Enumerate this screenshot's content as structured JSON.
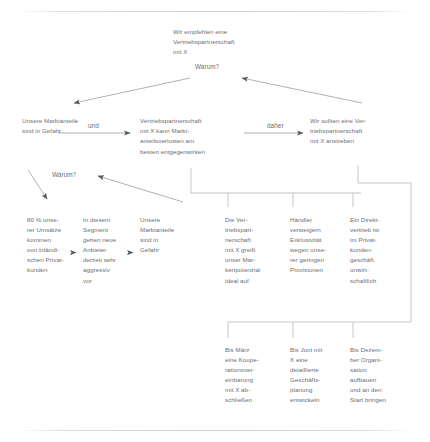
{
  "document": {
    "language": "de",
    "type": "pyramid-argument-diagram",
    "text_color": "#6d6e71",
    "line_color": "#8c8e90",
    "background": "#ffffff"
  },
  "top_statement": {
    "text": "Wir empfehlen eine\nVertriebspartnerschaft\nmit X"
  },
  "labels": {
    "warum_top": "Warum?",
    "warum_bottom": "Warum?"
  },
  "argument_row": {
    "left": {
      "text": "Unsere Marktanteile\nsind in Gefahr"
    },
    "connector_1": "und",
    "middle": {
      "text": "Vertriebspartnerschaft\nmit X kann Markt-\nanteilsverlusten am\nbesten entgegenwirken"
    },
    "connector_2": "daher",
    "right": {
      "text": "Wir sollten eine Ver-\ntriebspartnerschaft\nmit X anstreben"
    }
  },
  "evidence_columns": [
    {
      "id": "col-0",
      "text": "80 % unse-\nrer Umsätze\nkommen\nvon inländi-\nschen Privat-\nkunden"
    },
    {
      "id": "col-1",
      "text": "In diesem\nSegment\ngehen neue\nAnbieter\nderzeit sehr\naggressiv\nvor"
    },
    {
      "id": "col-2",
      "text": "Unsere\nMarktanteile\nsind in\nGefahr"
    },
    {
      "id": "col-3",
      "text": "Die Ver-\ntriebspart-\nnerschaft\nmit X greift\nunser Mar-\nkenpotenzial\nideal auf"
    },
    {
      "id": "col-4",
      "text": "Händler\nverweigern\nExklusivität\nwegen unse-\nrer geringen\nProvisionen"
    },
    {
      "id": "col-5",
      "text": "Ein Direkt-\nvertrieb ist\nim Privat-\nkunden-\ngeschäft\nunwirt-\nschaftlich"
    }
  ],
  "action_columns": [
    {
      "id": "acol-0",
      "text": "Bis März\neine Koope-\nrationsver-\neinbarung\nmit X ab-\nschließen"
    },
    {
      "id": "acol-1",
      "text": "Bis Juni mit\nX eine\ndetaillierte\nGeschäfts-\nplanung\nentwickeln"
    },
    {
      "id": "acol-2",
      "text": "Bis Dezem-\nber Organi-\nsation\naufbauen\nund an den\nStart bringen"
    }
  ]
}
